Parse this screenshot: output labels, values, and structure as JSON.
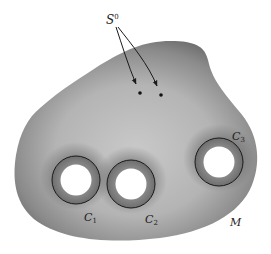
{
  "figure": {
    "surface_label": "M",
    "points_label": "S",
    "points_label_sup": "0",
    "boundary_circles": [
      {
        "label": "C",
        "sub": "1"
      },
      {
        "label": "C",
        "sub": "2"
      },
      {
        "label": "C",
        "sub": "3"
      }
    ],
    "colors": {
      "surface_edge": "#6e6e6e",
      "surface_center": "#c4c4c4",
      "line": "#1a1a1a",
      "hole": "#ffffff"
    }
  }
}
